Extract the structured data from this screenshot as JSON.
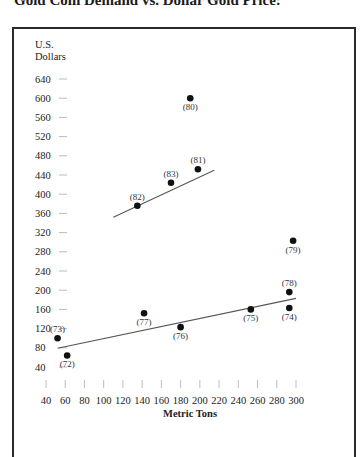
{
  "title": "Gold Coin Demand vs. Dollar Gold Price:",
  "chart_data": {
    "type": "scatter",
    "title": "Gold Coin Demand vs. Dollar Gold Price:",
    "xlabel": "Metric Tons",
    "ylabel": "U.S. Dollars",
    "ylabel_lines": [
      "U.S.",
      "Dollars"
    ],
    "xlim": [
      40,
      300
    ],
    "ylim": [
      40,
      640
    ],
    "x_ticks": [
      40,
      60,
      80,
      100,
      120,
      140,
      160,
      180,
      200,
      220,
      240,
      260,
      280,
      300
    ],
    "y_ticks": [
      640,
      600,
      560,
      520,
      480,
      440,
      400,
      360,
      320,
      280,
      240,
      200,
      160,
      120,
      80,
      40
    ],
    "grid": false,
    "points": [
      {
        "label": "(72)",
        "year": 1972,
        "x": 62,
        "y": 64,
        "label_pos": "below"
      },
      {
        "label": "(73)",
        "year": 1973,
        "x": 52,
        "y": 100,
        "label_pos": "above"
      },
      {
        "label": "(74)",
        "year": 1974,
        "x": 293,
        "y": 163,
        "label_pos": "below"
      },
      {
        "label": "(75)",
        "year": 1975,
        "x": 253,
        "y": 160,
        "label_pos": "below"
      },
      {
        "label": "(76)",
        "year": 1976,
        "x": 180,
        "y": 123,
        "label_pos": "below"
      },
      {
        "label": "(77)",
        "year": 1977,
        "x": 142,
        "y": 152,
        "label_pos": "below"
      },
      {
        "label": "(78)",
        "year": 1978,
        "x": 293,
        "y": 196,
        "label_pos": "above"
      },
      {
        "label": "(79)",
        "year": 1979,
        "x": 297,
        "y": 303,
        "label_pos": "below"
      },
      {
        "label": "(80)",
        "year": 1980,
        "x": 190,
        "y": 600,
        "label_pos": "below"
      },
      {
        "label": "(81)",
        "year": 1981,
        "x": 198,
        "y": 452,
        "label_pos": "above"
      },
      {
        "label": "(82)",
        "year": 1982,
        "x": 135,
        "y": 376,
        "label_pos": "above"
      },
      {
        "label": "(83)",
        "year": 1983,
        "x": 170,
        "y": 424,
        "label_pos": "above"
      }
    ],
    "trend_lines": [
      {
        "name": "1972-1979 trend",
        "x": [
          52,
          300
        ],
        "y": [
          79,
          183
        ]
      },
      {
        "name": "1981-1983 trend",
        "x": [
          110,
          215
        ],
        "y": [
          352,
          450
        ]
      }
    ]
  }
}
